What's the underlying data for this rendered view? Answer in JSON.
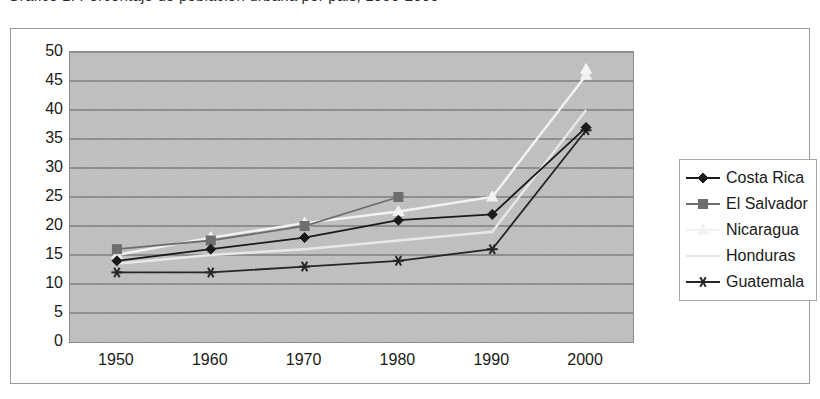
{
  "caption": {
    "text": "Grafico 1. Porcentaje de poblacion urbana por pais, 1950-2000"
  },
  "chart_data": {
    "type": "line",
    "title": "",
    "subtitle": "",
    "xlabel": "",
    "ylabel": "",
    "categories": [
      "1950",
      "1960",
      "1970",
      "1980",
      "1990",
      "2000"
    ],
    "x": [
      1950,
      1960,
      1970,
      1980,
      1990,
      2000
    ],
    "ylim": [
      0,
      50
    ],
    "ytick_step": 5,
    "yticks": [
      "50",
      "45",
      "40",
      "35",
      "30",
      "25",
      "20",
      "15",
      "10",
      "5",
      "0"
    ],
    "grid": "horizontal",
    "legend_position": "right",
    "plot_bgcolor": "#b9b9b9",
    "series": [
      {
        "name": "Costa Rica",
        "marker": "diamond",
        "color": "#1a1a1a",
        "values": [
          14,
          16,
          18,
          21,
          22,
          37
        ]
      },
      {
        "name": "El Salvador",
        "marker": "square",
        "color": "#6e6e6e",
        "values": [
          16,
          17.5,
          20,
          25,
          null,
          null
        ]
      },
      {
        "name": "Nicaragua",
        "marker": "triangle",
        "color": "#f2f2f2",
        "values": [
          15,
          18,
          20.5,
          22.5,
          25,
          46
        ]
      },
      {
        "name": "Honduras",
        "marker": "none",
        "color": "#e8e8e8",
        "values": [
          13.5,
          15,
          16,
          17.5,
          19,
          40
        ]
      },
      {
        "name": "Guatemala",
        "marker": "star",
        "color": "#262626",
        "values": [
          12,
          12,
          13,
          14,
          16,
          36.5
        ]
      }
    ],
    "extra_points": [
      {
        "series": "Guatemala-2000-star",
        "x": 2000,
        "y": 47
      }
    ]
  },
  "legend": {
    "items": [
      {
        "label": "Costa Rica",
        "key": "line-diamond-marker"
      },
      {
        "label": "El Salvador",
        "key": "line-square-marker"
      },
      {
        "label": "Nicaragua",
        "key": "line-faint-marker"
      },
      {
        "label": "Honduras",
        "key": "line-faint-plain"
      },
      {
        "label": "Guatemala",
        "key": "line-star-marker"
      }
    ]
  }
}
